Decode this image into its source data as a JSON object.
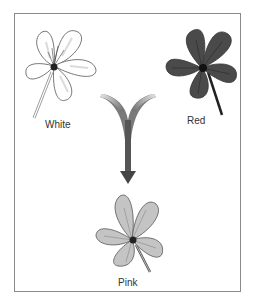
{
  "diagram": {
    "type": "genetic-cross-illustration",
    "parents": [
      {
        "label": "White",
        "color": "#ffffff"
      },
      {
        "label": "Red",
        "color": "#4a4a4a"
      }
    ],
    "offspring": {
      "label": "Pink",
      "color": "#bdbdbd"
    },
    "arrow": {
      "shape": "y-merge-down-arrow",
      "color": "#555555"
    },
    "frame_color": "#8a8a8a"
  }
}
